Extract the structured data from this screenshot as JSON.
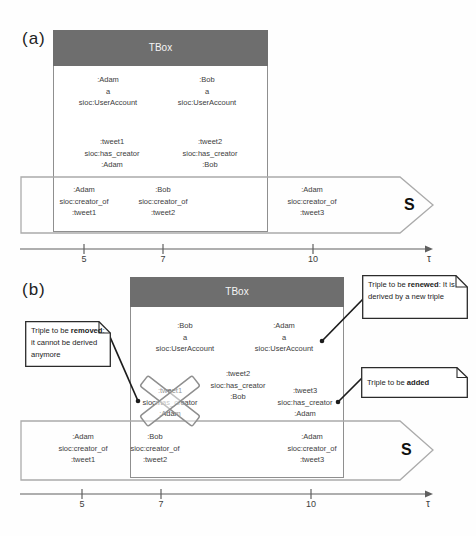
{
  "colors": {
    "tbox_header_bg": "#6e6e6e",
    "tbox_header_text": "#f5f5f5",
    "box_border": "#8f8f8f",
    "stream_border": "#ababab",
    "axis": "#5f5f5f",
    "text": "#3d3d3d",
    "callout_border": "#2b2b2b",
    "connector": "#1c1c1c",
    "cross": "#8f8f8f"
  },
  "panel_a": {
    "label": "(a)",
    "tbox_title": "TBox",
    "box_triples": [
      {
        "lines": [
          ":Adam",
          "a",
          "sioc:UserAccount"
        ]
      },
      {
        "lines": [
          ":Bob",
          "a",
          "sioc:UserAccount"
        ]
      },
      {
        "lines": [
          ":tweet1",
          "sioc:has_creator",
          ":Adam"
        ]
      },
      {
        "lines": [
          ":tweet2",
          "sioc:has_creator",
          ":Bob"
        ]
      }
    ],
    "stream_triples": [
      {
        "lines": [
          ":Adam",
          "sioc:creator_of",
          ":tweet1"
        ]
      },
      {
        "lines": [
          ":Bob",
          "sioc:creator_of",
          ":tweet2"
        ]
      },
      {
        "lines": [
          ":Adam",
          "sioc:creator_of",
          ":tweet3"
        ]
      }
    ],
    "stream_label": "S",
    "axis": {
      "ticks": [
        "5",
        "7",
        "10"
      ],
      "label": "τ"
    }
  },
  "panel_b": {
    "label": "(b)",
    "tbox_title": "TBox",
    "box_triples": [
      {
        "lines": [
          ":Bob",
          "a",
          "sioc:UserAccount"
        ]
      },
      {
        "lines": [
          ":Adam",
          "a",
          "sioc:UserAccount"
        ]
      },
      {
        "lines": [
          ":tweet2",
          "sioc:has_creator",
          ":Bob"
        ]
      },
      {
        "lines": [
          ":tweet1",
          "sioc:has_creator",
          ":Adam"
        ],
        "crossed": true
      },
      {
        "lines": [
          ":tweet3",
          "sioc:has_creator",
          ":Adam"
        ]
      }
    ],
    "stream_triples": [
      {
        "lines": [
          ":Adam",
          "sioc:creator_of",
          ":tweet1"
        ]
      },
      {
        "lines": [
          ":Bob",
          "sioc:creator_of",
          ":tweet2"
        ]
      },
      {
        "lines": [
          ":Adam",
          "sioc:creator_of",
          ":tweet3"
        ]
      }
    ],
    "stream_label": "S",
    "axis": {
      "ticks": [
        "5",
        "7",
        "10"
      ],
      "label": "τ"
    },
    "callouts": {
      "removed": {
        "pre": "Triple to be ",
        "bold": "removed",
        "post": ": it cannot be derived anymore"
      },
      "renewed": {
        "pre": "Triple to be ",
        "bold": "renewed",
        "post": ": It is derived by a new triple"
      },
      "added": {
        "pre": "Triple to be ",
        "bold": "added",
        "post": ""
      }
    }
  }
}
